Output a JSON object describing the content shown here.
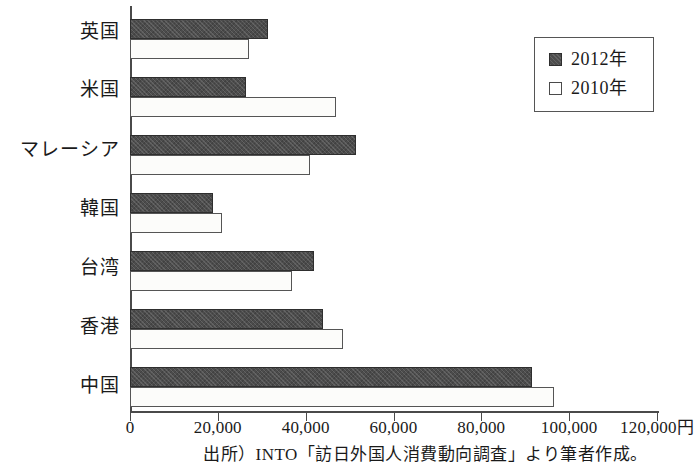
{
  "chart": {
    "type": "bar",
    "title": "",
    "source_note": "出所）INTO「訪日外国人消費動向調査」より筆者作成。",
    "currency_suffix": "円"
  },
  "legend": {
    "position": "top-right",
    "entries": [
      {
        "label": "2012年",
        "swatch": "filled-square-icon",
        "color": "#4c4c4c"
      },
      {
        "label": "2010年",
        "swatch": "hollow-square-icon",
        "color": "#ffffff"
      }
    ]
  },
  "axis": {
    "x_ticks": [
      "0",
      "20,000",
      "40,000",
      "60,000",
      "80,000",
      "100,000",
      "120,000円"
    ],
    "x_tick_values": [
      0,
      20000,
      40000,
      60000,
      80000,
      100000,
      120000
    ],
    "x_min": 0,
    "x_max": 120000,
    "grid": false
  },
  "chart_data": {
    "type": "bar",
    "orientation": "horizontal",
    "title": "",
    "xlabel": "",
    "ylabel": "",
    "xlim": [
      0,
      120000
    ],
    "grid": false,
    "legend_position": "top-right",
    "categories": [
      "英国",
      "米国",
      "マレーシア",
      "韓国",
      "台湾",
      "香港",
      "中国"
    ],
    "series": [
      {
        "name": "2012年",
        "values": [
          31500,
          26500,
          51500,
          19000,
          42000,
          44000,
          91500
        ]
      },
      {
        "name": "2010年",
        "values": [
          27000,
          47000,
          41000,
          21000,
          37000,
          48500,
          96500
        ]
      }
    ],
    "xtick_labels": [
      "0",
      "20,000",
      "40,000",
      "60,000",
      "80,000",
      "100,000",
      "120,000円"
    ],
    "annotations": [
      "出所）INTO「訪日外国人消費動向調査」より筆者作成。"
    ]
  }
}
